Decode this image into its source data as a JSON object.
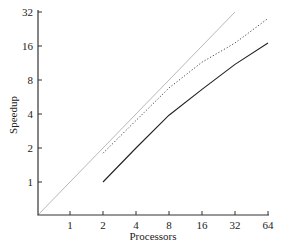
{
  "chart_data": {
    "type": "line",
    "title": "",
    "xlabel": "Processors",
    "ylabel": "Speedup",
    "xscale": "log2",
    "yscale": "log2",
    "x_ticks": [
      "1",
      "2",
      "4",
      "8",
      "16",
      "32",
      "64"
    ],
    "y_ticks": [
      "1",
      "2",
      "4",
      "8",
      "16",
      "32"
    ],
    "grid": false,
    "legend": null,
    "series": [
      {
        "name": "ideal",
        "style": "solid-light-gray",
        "color": "#b8b8b8",
        "x": [
          0.5,
          32
        ],
        "y": [
          0.5,
          32
        ]
      },
      {
        "name": "dotted",
        "style": "dotted",
        "color": "#444444",
        "x": [
          2,
          4,
          8,
          16,
          32,
          64
        ],
        "y": [
          1.8,
          3.5,
          6.8,
          11.5,
          17,
          28
        ]
      },
      {
        "name": "solid",
        "style": "solid",
        "color": "#222222",
        "x": [
          2,
          4,
          8,
          16,
          32,
          64
        ],
        "y": [
          1,
          2,
          3.9,
          6.6,
          11,
          17
        ]
      }
    ]
  }
}
